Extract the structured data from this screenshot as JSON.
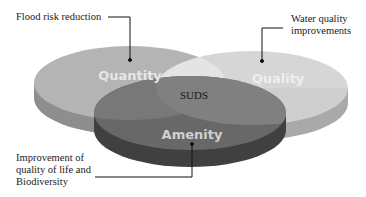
{
  "diagram": {
    "type": "venn-3-discs",
    "center_label": "SUDS",
    "discs": [
      {
        "id": "quantity",
        "label": "Quantity",
        "color": "#b4b4b4",
        "side_color": "#8e8e8e"
      },
      {
        "id": "quality",
        "label": "Quality",
        "color": "#d2d2d2",
        "side_color": "#a9a9a9"
      },
      {
        "id": "amenity",
        "label": "Amenity",
        "color": "#6a6a6a",
        "side_color": "#404040"
      }
    ],
    "label_color": "#e6e6e6"
  },
  "callouts": {
    "quantity": {
      "text": "Flood risk reduction"
    },
    "quality": {
      "lines": [
        "Water quality",
        "improvements"
      ]
    },
    "amenity": {
      "lines": [
        "Improvement of",
        "quality of life and",
        "Biodiversity"
      ]
    }
  }
}
